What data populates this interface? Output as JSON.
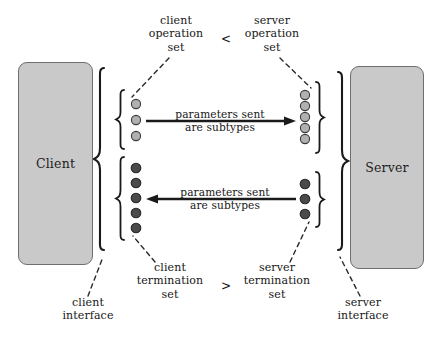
{
  "diagram": {
    "title_nodes": {
      "client": "Client",
      "server": "Server"
    },
    "captions": {
      "client_operation_set": "client\noperation\nset",
      "server_operation_set": "server\noperation\nset",
      "client_termination_set": "client\ntermination\nset",
      "server_termination_set": "server\ntermination\nset",
      "client_interface": "client\ninterface",
      "server_interface": "server\ninterface"
    },
    "relations": {
      "operation_relation": "<",
      "termination_relation": ">"
    },
    "arrows": {
      "top": {
        "label": "parameters sent\nare subtypes",
        "direction": "right"
      },
      "bottom": {
        "label": "parameters sent\nare subtypes",
        "direction": "left"
      }
    },
    "sets": {
      "client_operations": {
        "count": 3,
        "style": "light"
      },
      "client_terminations": {
        "count": 5,
        "style": "dark"
      },
      "server_operations": {
        "count": 5,
        "style": "light"
      },
      "server_terminations": {
        "count": 3,
        "style": "dark"
      }
    },
    "colors": {
      "box_fill": "#c9c9c9",
      "box_stroke": "#6e6e6e",
      "light_dot": "#b0b0b0",
      "dark_dot": "#4a4a4a",
      "dot_stroke": "#333333",
      "line": "#1a1a1a",
      "text": "#161616"
    }
  }
}
